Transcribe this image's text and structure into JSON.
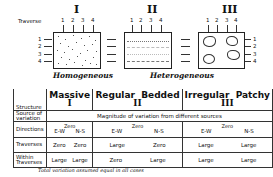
{
  "diagram": {
    "traverse_label": "Traverse",
    "traverse_numbers": [
      "1",
      "2",
      "3",
      "4"
    ],
    "panels": [
      {
        "roman": "I",
        "pattern": "dotted-uniform"
      },
      {
        "roman": "II",
        "pattern": "bedded-layers"
      },
      {
        "roman": "III",
        "pattern": "patches"
      }
    ],
    "equals_sign": "=",
    "captions": {
      "left": "Homogeneous",
      "right": "Heterogeneous"
    }
  },
  "table": {
    "header": {
      "row_label": "Structure",
      "columns": [
        {
          "name": "Massive",
          "roman": "I"
        },
        {
          "name": "Regular  Bedded",
          "roman": "II"
        },
        {
          "name": "Irregular  Patchy",
          "roman": "III"
        }
      ]
    },
    "source_row": {
      "label": "Source of variation",
      "value": "Magnitude of variation from different sources"
    },
    "rows": [
      {
        "label": "Directions",
        "zero_note": "Zero",
        "values": [
          [
            "E-W",
            "N-S"
          ],
          [
            "E-W",
            "N-S"
          ],
          [
            "E-W",
            "N-S"
          ]
        ]
      },
      {
        "label": "Traverses",
        "values": [
          [
            "Zero",
            "Zero"
          ],
          [
            "Large",
            "Zero"
          ],
          [
            "Large",
            "Large"
          ]
        ]
      },
      {
        "label": "Within Traverses",
        "values": [
          [
            "Large",
            "Large"
          ],
          [
            "Zero",
            "Large"
          ],
          [
            "Large",
            "Large"
          ]
        ]
      }
    ]
  },
  "footer": "Total variation assumed equal in all cases"
}
